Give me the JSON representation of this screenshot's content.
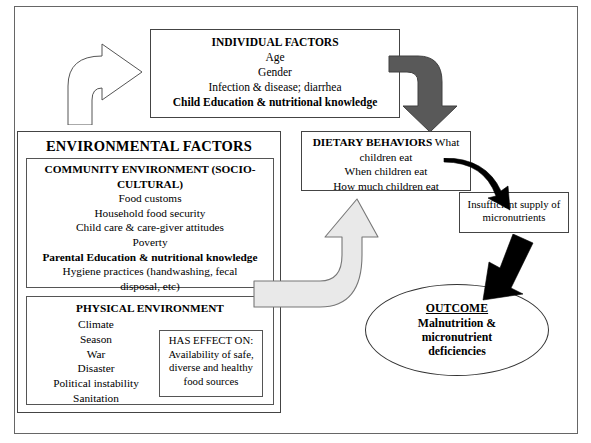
{
  "diagram": {
    "individual_factors": {
      "heading": "INDIVIDUAL FACTORS",
      "lines": [
        "Age",
        "Gender",
        "Infection & disease; diarrhea"
      ],
      "bold_line": "Child Education & nutritional knowledge"
    },
    "environmental_factors": {
      "heading": "ENVIRONMENTAL FACTORS",
      "community": {
        "heading_line1": "COMMUNITY ENVIRONMENT (SOCIO-",
        "heading_line2": "CULTURAL)",
        "lines": [
          "Food customs",
          "Household food security",
          "Child care & care-giver attitudes",
          "Poverty"
        ],
        "bold_line": "Parental Education & nutritional knowledge",
        "trailing_lines": [
          "Hygiene practices (handwashing, fecal",
          "disposal, etc)"
        ]
      },
      "physical": {
        "heading": "PHYSICAL ENVIRONMENT",
        "lines": [
          "Climate",
          "Season",
          "War",
          "Disaster",
          "Political instability",
          "Sanitation"
        ],
        "has_effect": {
          "heading": "HAS EFFECT ON:",
          "lines": [
            "Availability of safe,",
            "diverse and healthy",
            "food sources"
          ]
        }
      }
    },
    "dietary_behaviors": {
      "heading": "DIETARY BEHAVIORS",
      "lines": [
        " What",
        "children eat",
        "When children eat",
        "How much children eat"
      ]
    },
    "insufficient_supply": {
      "lines": [
        "Insufficient supply of",
        "micronutrients"
      ]
    },
    "outcome": {
      "heading": "OUTCOME",
      "lines": [
        "Malnutrition &",
        "micronutrient",
        "deficiencies"
      ]
    },
    "arrows": [
      {
        "name": "environmental-to-individual-arrow",
        "style": "white-outline-curved",
        "color": "#ffffff",
        "stroke": "#555555"
      },
      {
        "name": "individual-to-dietary-arrow",
        "style": "dark-gray-curved",
        "color": "#595959",
        "stroke": "#404040"
      },
      {
        "name": "environmental-to-dietary-arrow",
        "style": "light-gray-curved",
        "color": "#e8e8e8",
        "stroke": "#777777"
      },
      {
        "name": "dietary-to-insufficient-arrow",
        "style": "black-curved",
        "color": "#000000",
        "stroke": "#000000"
      },
      {
        "name": "insufficient-to-outcome-arrow",
        "style": "black-thick",
        "color": "#000000",
        "stroke": "#000000"
      }
    ]
  }
}
